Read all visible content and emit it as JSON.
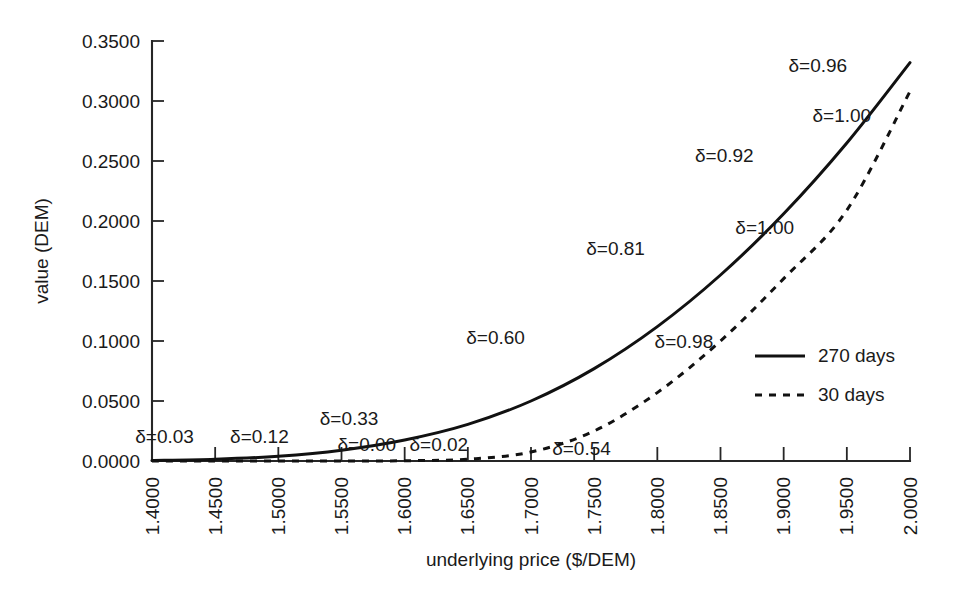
{
  "chart_data": {
    "type": "line",
    "title": "",
    "xlabel": "underlying price ($/DEM)",
    "ylabel": "value (DEM)",
    "xlim": [
      1.4,
      2.0
    ],
    "ylim": [
      0.0,
      0.35
    ],
    "grid": false,
    "legend_position": "center-right",
    "x_tick_labels": [
      "1.4000",
      "1.4500",
      "1.5000",
      "1.5500",
      "1.6000",
      "1.6500",
      "1.7000",
      "1.7500",
      "1.8000",
      "1.8500",
      "1.9000",
      "1.9500",
      "2.0000"
    ],
    "x_tick_values": [
      1.4,
      1.45,
      1.5,
      1.55,
      1.6,
      1.65,
      1.7,
      1.75,
      1.8,
      1.85,
      1.9,
      1.95,
      2.0
    ],
    "y_tick_labels": [
      "0.0000",
      "0.0500",
      "0.1000",
      "0.1500",
      "0.2000",
      "0.2500",
      "0.3000",
      "0.3500"
    ],
    "y_tick_values": [
      0.0,
      0.05,
      0.1,
      0.15,
      0.2,
      0.25,
      0.3,
      0.35
    ],
    "x": [
      1.4,
      1.45,
      1.5,
      1.55,
      1.6,
      1.65,
      1.7,
      1.75,
      1.8,
      1.85,
      1.9,
      1.95,
      2.0
    ],
    "series": [
      {
        "name": "270 days",
        "style": "solid",
        "values": [
          0.0005,
          0.0015,
          0.004,
          0.009,
          0.0175,
          0.0305,
          0.05,
          0.077,
          0.112,
          0.155,
          0.206,
          0.265,
          0.332
        ]
      },
      {
        "name": "30 days",
        "style": "dashed",
        "values": [
          0.0,
          0.0,
          0.0,
          0.0,
          0.0002,
          0.0015,
          0.0075,
          0.025,
          0.057,
          0.1,
          0.152,
          0.209,
          0.308
        ]
      }
    ],
    "annotations": [
      {
        "text": "δ=0.03",
        "series": "270 days",
        "delta": 0.03,
        "x": 1.41,
        "y": 0.012
      },
      {
        "text": "δ=0.12",
        "series": "270 days",
        "delta": 0.12,
        "x": 1.485,
        "y": 0.012
      },
      {
        "text": "δ=0.33",
        "series": "270 days",
        "delta": 0.33,
        "x": 1.556,
        "y": 0.027
      },
      {
        "text": "δ=0.60",
        "series": "270 days",
        "delta": 0.6,
        "x": 1.672,
        "y": 0.094
      },
      {
        "text": "δ=0.81",
        "series": "270 days",
        "delta": 0.81,
        "x": 1.767,
        "y": 0.168
      },
      {
        "text": "δ=0.92",
        "series": "270 days",
        "delta": 0.92,
        "x": 1.853,
        "y": 0.246
      },
      {
        "text": "δ=0.96",
        "series": "270 days",
        "delta": 0.96,
        "x": 1.927,
        "y": 0.321
      },
      {
        "text": "δ=0.00",
        "series": "30 days",
        "delta": 0.0,
        "x": 1.57,
        "y": 0.005
      },
      {
        "text": "δ=0.02",
        "series": "30 days",
        "delta": 0.02,
        "x": 1.627,
        "y": 0.005
      },
      {
        "text": "δ=0.54",
        "series": "30 days",
        "delta": 0.54,
        "x": 1.74,
        "y": 0.002
      },
      {
        "text": "δ=0.98",
        "series": "30 days",
        "delta": 0.98,
        "x": 1.821,
        "y": 0.091
      },
      {
        "text": "δ=1.00",
        "series": "30 days",
        "delta": 1.0,
        "x": 1.885,
        "y": 0.186
      },
      {
        "text": "δ=1.00",
        "series": "30 days",
        "delta": 1.0,
        "x": 1.946,
        "y": 0.279
      }
    ],
    "legend_entries": [
      {
        "label": "270 days",
        "style": "solid"
      },
      {
        "label": "30 days",
        "style": "dashed"
      }
    ]
  }
}
